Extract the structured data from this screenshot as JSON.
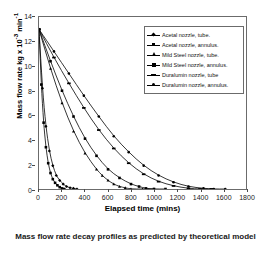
{
  "caption": "Mass flow rate decay profiles as predicted by theoretical model",
  "chart_data": {
    "type": "line",
    "title": "Mass flow rate decay profiles as predicted by theoretical model",
    "xlabel": "Elapsed time (mins)",
    "ylabel": "Mass flow rate kg x 10-3 min-1",
    "ylabel_parts": {
      "prefix": "Mass flow rate kg x 10",
      "exp1": "-3",
      "mid": " min",
      "exp2": "-1"
    },
    "xlim": [
      0,
      1800
    ],
    "ylim": [
      0,
      14
    ],
    "xticks": [
      0,
      200,
      400,
      600,
      800,
      1000,
      1200,
      1400,
      1600,
      1800
    ],
    "yticks": [
      0,
      2,
      4,
      6,
      8,
      10,
      12,
      14
    ],
    "grid": false,
    "legend_position": "upper-right",
    "series": [
      {
        "name": "Acetal nozzle, tube.",
        "marker": "diamond",
        "points": [
          [
            0,
            13.0
          ],
          [
            30,
            8.2
          ],
          [
            60,
            5.1
          ],
          [
            90,
            3.1
          ],
          [
            120,
            1.9
          ],
          [
            150,
            1.1
          ],
          [
            180,
            0.7
          ],
          [
            210,
            0.4
          ],
          [
            240,
            0.2
          ],
          [
            270,
            0.1
          ],
          [
            300,
            0.05
          ],
          [
            330,
            0.0
          ]
        ]
      },
      {
        "name": "Acetal nozzle, annulus.",
        "marker": "square",
        "points": [
          [
            0,
            13.0
          ],
          [
            20,
            8.5
          ],
          [
            40,
            5.4
          ],
          [
            60,
            3.4
          ],
          [
            80,
            2.1
          ],
          [
            100,
            1.3
          ],
          [
            120,
            0.8
          ],
          [
            140,
            0.5
          ],
          [
            160,
            0.3
          ],
          [
            180,
            0.15
          ],
          [
            200,
            0.05
          ],
          [
            220,
            0.0
          ]
        ]
      },
      {
        "name": "Mild Steel nozzle, tube.",
        "marker": "triangle",
        "points": [
          [
            0,
            13.0
          ],
          [
            100,
            9.8
          ],
          [
            200,
            7.0
          ],
          [
            300,
            4.7
          ],
          [
            400,
            2.9
          ],
          [
            500,
            1.6
          ],
          [
            550,
            1.1
          ],
          [
            600,
            0.7
          ],
          [
            650,
            0.4
          ],
          [
            700,
            0.2
          ],
          [
            750,
            0.1
          ],
          [
            800,
            0.0
          ],
          [
            900,
            0.0
          ],
          [
            1000,
            0.0
          ]
        ]
      },
      {
        "name": "Mild Steel nozzle, annulus.",
        "marker": "cross",
        "points": [
          [
            0,
            13.0
          ],
          [
            100,
            10.4
          ],
          [
            200,
            8.0
          ],
          [
            300,
            5.9
          ],
          [
            400,
            4.1
          ],
          [
            500,
            2.7
          ],
          [
            600,
            1.6
          ],
          [
            700,
            0.9
          ],
          [
            800,
            0.4
          ],
          [
            870,
            0.2
          ],
          [
            930,
            0.05
          ],
          [
            1000,
            0.0
          ],
          [
            1100,
            0.0
          ]
        ]
      },
      {
        "name": "Duralumin nozzle, tube",
        "marker": "bar",
        "points": [
          [
            0,
            13.0
          ],
          [
            130,
            10.7
          ],
          [
            260,
            8.6
          ],
          [
            390,
            6.6
          ],
          [
            520,
            4.8
          ],
          [
            650,
            3.3
          ],
          [
            780,
            2.1
          ],
          [
            910,
            1.2
          ],
          [
            1040,
            0.6
          ],
          [
            1170,
            0.25
          ],
          [
            1300,
            0.05
          ],
          [
            1400,
            0.0
          ],
          [
            1500,
            0.0
          ]
        ]
      },
      {
        "name": "Duralumin nozzle, annulus.",
        "marker": "circle",
        "points": [
          [
            0,
            13.0
          ],
          [
            130,
            11.2
          ],
          [
            260,
            9.4
          ],
          [
            390,
            7.6
          ],
          [
            520,
            5.9
          ],
          [
            650,
            4.3
          ],
          [
            780,
            3.0
          ],
          [
            910,
            1.9
          ],
          [
            1040,
            1.1
          ],
          [
            1170,
            0.55
          ],
          [
            1300,
            0.2
          ],
          [
            1430,
            0.05
          ],
          [
            1520,
            0.0
          ],
          [
            1620,
            0.0
          ]
        ]
      }
    ]
  }
}
